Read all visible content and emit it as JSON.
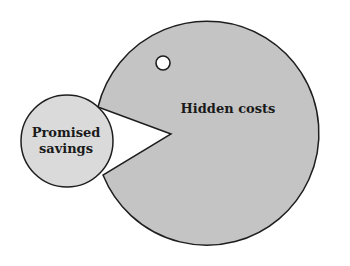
{
  "diagram": {
    "type": "pacman-metaphor",
    "big_shape": {
      "label": "Hidden costs",
      "fill": "#c4c4c4",
      "stroke": "#1e1e1e",
      "center": [
        221,
        132
      ],
      "radius": 112,
      "mouth_vertex": [
        171,
        134
      ],
      "mouth_upper": [
        98,
        107
      ],
      "mouth_lower": [
        103,
        175
      ]
    },
    "eye": {
      "center": [
        163,
        63
      ],
      "radius": 7,
      "fill": "#ffffff",
      "stroke": "#1e1e1e"
    },
    "small_shape": {
      "label_line1": "Promised",
      "label_line2": "savings",
      "fill": "#dadada",
      "stroke": "#1e1e1e",
      "center": [
        67,
        141
      ],
      "radius": 46
    }
  }
}
